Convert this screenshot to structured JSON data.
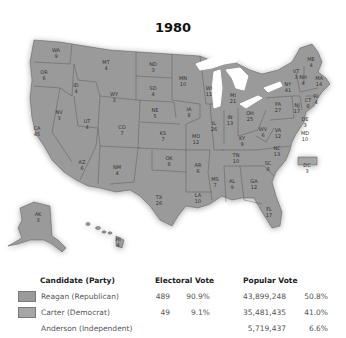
{
  "title": "1980",
  "colors": {
    "republican": "#9a9a9a",
    "democrat": "#a6a6a6",
    "state_border": "#555555",
    "water": "#ffffff",
    "background": "#ffffff"
  },
  "states": [
    {
      "abbr": "WA",
      "ev": "9",
      "x": 56,
      "y": 53
    },
    {
      "abbr": "OR",
      "ev": "6",
      "x": 44,
      "y": 75
    },
    {
      "abbr": "CA",
      "ev": "45",
      "x": 37,
      "y": 131
    },
    {
      "abbr": "NV",
      "ev": "3",
      "x": 59,
      "y": 115
    },
    {
      "abbr": "ID",
      "ev": "4",
      "x": 76,
      "y": 88
    },
    {
      "abbr": "MT",
      "ev": "4",
      "x": 106,
      "y": 65
    },
    {
      "abbr": "WY",
      "ev": "3",
      "x": 114,
      "y": 97
    },
    {
      "abbr": "UT",
      "ev": "4",
      "x": 87,
      "y": 124
    },
    {
      "abbr": "CO",
      "ev": "7",
      "x": 122,
      "y": 130
    },
    {
      "abbr": "AZ",
      "ev": "6",
      "x": 82,
      "y": 165
    },
    {
      "abbr": "NM",
      "ev": "4",
      "x": 117,
      "y": 170
    },
    {
      "abbr": "ND",
      "ev": "3",
      "x": 153,
      "y": 67
    },
    {
      "abbr": "SD",
      "ev": "4",
      "x": 153,
      "y": 91
    },
    {
      "abbr": "NE",
      "ev": "5",
      "x": 155,
      "y": 113
    },
    {
      "abbr": "KS",
      "ev": "7",
      "x": 163,
      "y": 136
    },
    {
      "abbr": "OK",
      "ev": "8",
      "x": 169,
      "y": 161
    },
    {
      "abbr": "TX",
      "ev": "26",
      "x": 159,
      "y": 200
    },
    {
      "abbr": "MN",
      "ev": "10",
      "x": 183,
      "y": 81
    },
    {
      "abbr": "IA",
      "ev": "8",
      "x": 189,
      "y": 112
    },
    {
      "abbr": "MO",
      "ev": "12",
      "x": 196,
      "y": 139
    },
    {
      "abbr": "AR",
      "ev": "6",
      "x": 198,
      "y": 168
    },
    {
      "abbr": "LA",
      "ev": "10",
      "x": 198,
      "y": 198
    },
    {
      "abbr": "WI",
      "ev": "11",
      "x": 209,
      "y": 91
    },
    {
      "abbr": "IL",
      "ev": "26",
      "x": 214,
      "y": 126
    },
    {
      "abbr": "MS",
      "ev": "7",
      "x": 215,
      "y": 182
    },
    {
      "abbr": "MI",
      "ev": "21",
      "x": 233,
      "y": 98
    },
    {
      "abbr": "IN",
      "ev": "13",
      "x": 230,
      "y": 120
    },
    {
      "abbr": "KY",
      "ev": "9",
      "x": 242,
      "y": 141
    },
    {
      "abbr": "TN",
      "ev": "10",
      "x": 236,
      "y": 158
    },
    {
      "abbr": "AL",
      "ev": "9",
      "x": 232,
      "y": 184
    },
    {
      "abbr": "GA",
      "ev": "12",
      "x": 254,
      "y": 184
    },
    {
      "abbr": "FL",
      "ev": "17",
      "x": 269,
      "y": 212
    },
    {
      "abbr": "OH",
      "ev": "25",
      "x": 250,
      "y": 116
    },
    {
      "abbr": "WV",
      "ev": "6",
      "x": 263,
      "y": 132
    },
    {
      "abbr": "VA",
      "ev": "12",
      "x": 278,
      "y": 133
    },
    {
      "abbr": "NC",
      "ev": "13",
      "x": 277,
      "y": 151
    },
    {
      "abbr": "SC",
      "ev": "8",
      "x": 268,
      "y": 166
    },
    {
      "abbr": "PA",
      "ev": "27",
      "x": 278,
      "y": 107
    },
    {
      "abbr": "NY",
      "ev": "41",
      "x": 288,
      "y": 87
    },
    {
      "abbr": "VT",
      "ev": "3",
      "x": 296,
      "y": 74
    },
    {
      "abbr": "NH",
      "ev": "4",
      "x": 303,
      "y": 80
    },
    {
      "abbr": "ME",
      "ev": "4",
      "x": 311,
      "y": 62
    },
    {
      "abbr": "MA",
      "ev": "14",
      "x": 319,
      "y": 81
    },
    {
      "abbr": "RI",
      "ev": "4",
      "x": 316,
      "y": 99
    },
    {
      "abbr": "CT",
      "ev": "8",
      "x": 308,
      "y": 103
    },
    {
      "abbr": "NJ",
      "ev": "17",
      "x": 297,
      "y": 108
    },
    {
      "abbr": "DE",
      "ev": "3",
      "x": 305,
      "y": 122
    },
    {
      "abbr": "MD",
      "ev": "10",
      "x": 305,
      "y": 136
    },
    {
      "abbr": "DC",
      "ev": "3",
      "x": 307,
      "y": 168
    },
    {
      "abbr": "AK",
      "ev": "3",
      "x": 38,
      "y": 217
    },
    {
      "abbr": "HI",
      "ev": "4",
      "x": 118,
      "y": 242
    }
  ],
  "legend": {
    "headers": {
      "candidate": "Candidate (Party)",
      "electoral": "Electoral Vote",
      "popular": "Popular Vote"
    },
    "rows": [
      {
        "candidate": "Reagan (Republican)",
        "ev": "489",
        "ev_pct": "90.9%",
        "pv": "43,899,248",
        "pv_pct": "50.8%",
        "swatch": "republican"
      },
      {
        "candidate": "Carter (Democrat)",
        "ev": "49",
        "ev_pct": "9.1%",
        "pv": "35,481,435",
        "pv_pct": "41.0%",
        "swatch": "democrat"
      },
      {
        "candidate": "Anderson (Independent)",
        "ev": "",
        "ev_pct": "",
        "pv": "5,719,437",
        "pv_pct": "6.6%",
        "swatch": ""
      }
    ]
  }
}
